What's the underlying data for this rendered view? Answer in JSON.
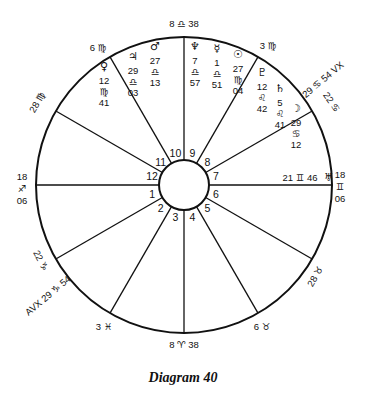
{
  "caption": "Diagram 40",
  "wheel": {
    "center": [
      184,
      185
    ],
    "outer_radius": 148,
    "inner_radius": 25,
    "line_color": "#111111",
    "house_system": "equal"
  },
  "cusps": [
    {
      "house": 1,
      "angle": 180,
      "label": "18 ♐ 06"
    },
    {
      "house": 2,
      "angle": 150,
      "label": "22 ♑"
    },
    {
      "house": 3,
      "angle": 120,
      "label": "3 ♓"
    },
    {
      "house": 4,
      "angle": 90,
      "label": "8 ♈ 38"
    },
    {
      "house": 5,
      "angle": 60,
      "label": "6 ♉"
    },
    {
      "house": 6,
      "angle": 30,
      "label": "28 ♉"
    },
    {
      "house": 7,
      "angle": 0,
      "label": "18 ♊ 06"
    },
    {
      "house": 8,
      "angle": 330,
      "label": "22 ♋"
    },
    {
      "house": 9,
      "angle": 300,
      "label": "3 ♍"
    },
    {
      "house": 10,
      "angle": 270,
      "label": "8 ♎ 38"
    },
    {
      "house": 11,
      "angle": 240,
      "label": "6 ♏"
    },
    {
      "house": 12,
      "angle": 210,
      "label": "28 ♏"
    }
  ],
  "outer_labels": [
    {
      "text": "18",
      "x": 22,
      "y": 180
    },
    {
      "text": "♐",
      "x": 22,
      "y": 192
    },
    {
      "text": "06",
      "x": 22,
      "y": 204
    },
    {
      "text": "28 ♍",
      "x": 40,
      "y": 104,
      "rotate": -60
    },
    {
      "text": "6 ♍",
      "x": 98,
      "y": 51
    },
    {
      "text": "8 ♎ 38",
      "x": 184,
      "y": 27
    },
    {
      "text": "3 ♍",
      "x": 268,
      "y": 49
    },
    {
      "text": "29 ♋ 54 VX",
      "x": 325,
      "y": 82,
      "rotate": -40
    },
    {
      "text": "22 ♋",
      "x": 329,
      "y": 104,
      "rotate": 55
    },
    {
      "text": "18",
      "x": 340,
      "y": 178
    },
    {
      "text": "♊",
      "x": 340,
      "y": 190
    },
    {
      "text": "06",
      "x": 340,
      "y": 202
    },
    {
      "text": "28 ♉",
      "x": 318,
      "y": 278,
      "rotate": -60
    },
    {
      "text": "6 ♉",
      "x": 262,
      "y": 330
    },
    {
      "text": "8 ♈ 38",
      "x": 184,
      "y": 348
    },
    {
      "text": "3 ♓",
      "x": 104,
      "y": 330
    },
    {
      "text": "22 ♑",
      "x": 38,
      "y": 262,
      "rotate": 62
    },
    {
      "text": "AVX 29 ♑ 54",
      "x": 50,
      "y": 298,
      "rotate": -40
    }
  ],
  "planets": [
    {
      "name": "Venus",
      "glyph": "♀",
      "deg": "12",
      "sign": "♍",
      "min": "41",
      "x": 104,
      "y": 70
    },
    {
      "name": "Jupiter",
      "glyph": "♃",
      "deg": "29",
      "sign": "♎",
      "min": "03",
      "x": 133,
      "y": 60
    },
    {
      "name": "Mars",
      "glyph": "♂",
      "deg": "27",
      "sign": "♎",
      "min": "13",
      "x": 155,
      "y": 50
    },
    {
      "name": "Neptune",
      "glyph": "♆",
      "deg": "7",
      "sign": "♎",
      "min": "57",
      "x": 195,
      "y": 50
    },
    {
      "name": "Mercury",
      "glyph": "☿",
      "deg": "1",
      "sign": "♎",
      "min": "51",
      "x": 217,
      "y": 52
    },
    {
      "name": "Sun",
      "glyph": "☉",
      "deg": "27",
      "sign": "♍",
      "min": "04",
      "x": 238,
      "y": 58
    },
    {
      "name": "Pluto",
      "glyph": "♇",
      "deg": "12",
      "sign": "♌",
      "min": "42",
      "x": 262,
      "y": 76
    },
    {
      "name": "Saturn",
      "glyph": "♄",
      "deg": "5",
      "sign": "♌",
      "min": "41",
      "x": 280,
      "y": 92
    },
    {
      "name": "Moon",
      "glyph": "☽",
      "deg": "29",
      "sign": "♋",
      "min": "12",
      "x": 296,
      "y": 112
    },
    {
      "name": "Uranus",
      "glyph": "♅",
      "deg": "21",
      "sign": "♊",
      "min": "46",
      "x": 300,
      "y": 181,
      "inline": true
    }
  ],
  "house_numbers": [
    "1",
    "2",
    "3",
    "4",
    "5",
    "6",
    "7",
    "8",
    "9",
    "10",
    "11",
    "12"
  ]
}
